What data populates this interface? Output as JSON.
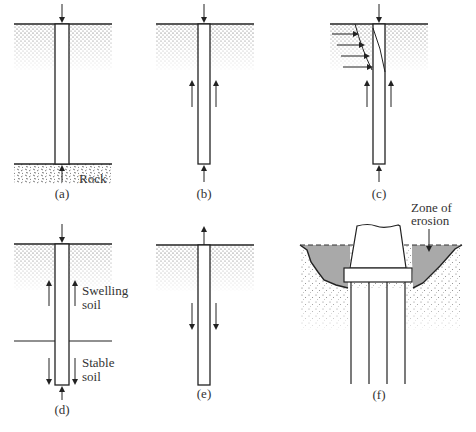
{
  "figure": {
    "panels": [
      {
        "id": "a",
        "label": "(a)",
        "annotations": [
          "Rock"
        ]
      },
      {
        "id": "b",
        "label": "(b)",
        "annotations": []
      },
      {
        "id": "c",
        "label": "(c)",
        "annotations": []
      },
      {
        "id": "d",
        "label": "(d)",
        "annotations": [
          "Swelling soil",
          "Stable soil"
        ]
      },
      {
        "id": "e",
        "label": "(e)",
        "annotations": []
      },
      {
        "id": "f",
        "label": "(f)",
        "annotations": [
          "Zone of erosion"
        ]
      }
    ],
    "text": {
      "rock": "Rock",
      "swelling_1": "Swelling",
      "swelling_2": "soil",
      "stable_1": "Stable",
      "stable_2": "soil",
      "erosion_1": "Zone of",
      "erosion_2": "erosion"
    },
    "colors": {
      "line": "#222222",
      "soil_dots": "#555555",
      "erosion_fill": "#a9a9a9",
      "background": "#ffffff"
    }
  }
}
